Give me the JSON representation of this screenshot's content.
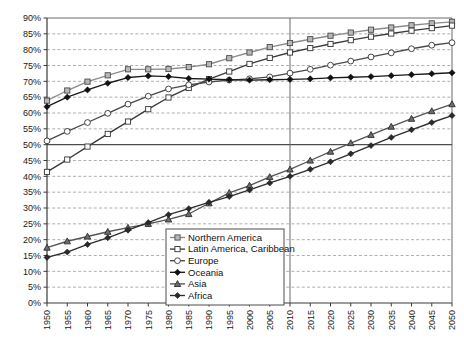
{
  "chart_data": {
    "type": "line",
    "title": "",
    "subtitle": "",
    "xlabel": "",
    "ylabel": "",
    "x": [
      1950,
      1955,
      1960,
      1965,
      1970,
      1975,
      1980,
      1985,
      1990,
      1995,
      2000,
      2005,
      2010,
      2015,
      2020,
      2025,
      2030,
      2035,
      2040,
      2045,
      2050
    ],
    "xlim": [
      1950,
      2050
    ],
    "ylim": [
      0,
      90
    ],
    "ytick_labels": [
      "0%",
      "5%",
      "10%",
      "15%",
      "20%",
      "25%",
      "30%",
      "35%",
      "40%",
      "45%",
      "50%",
      "55%",
      "60%",
      "65%",
      "70%",
      "75%",
      "80%",
      "85%",
      "90%"
    ],
    "ytick_values": [
      0,
      5,
      10,
      15,
      20,
      25,
      30,
      35,
      40,
      45,
      50,
      55,
      60,
      65,
      70,
      75,
      80,
      85,
      90
    ],
    "xtick_labels": [
      "1950",
      "1955",
      "1960",
      "1965",
      "1970",
      "1975",
      "1980",
      "1985",
      "1990",
      "1995",
      "2000",
      "2005",
      "2010",
      "2015",
      "2020",
      "2025",
      "2030",
      "2035",
      "2040",
      "2045",
      "2050"
    ],
    "grid": "horizontal-dashed",
    "emphasis_hline": 50,
    "divider_vline": 2010,
    "legend_position": "bottom-center",
    "series": [
      {
        "name": "Northern America",
        "marker": "square-open-gray",
        "color": "#8c8c8c",
        "values": [
          63.9,
          67.1,
          69.9,
          71.9,
          73.8,
          73.8,
          73.9,
          74.5,
          75.4,
          77.3,
          79.1,
          80.8,
          82.1,
          83.3,
          84.4,
          85.4,
          86.3,
          87.0,
          87.7,
          88.3,
          88.8
        ]
      },
      {
        "name": "Latin America, Caribbean",
        "marker": "square-open-white",
        "color": "#3a3a3a",
        "values": [
          41.4,
          45.3,
          49.4,
          53.4,
          57.3,
          61.2,
          64.9,
          67.9,
          70.7,
          73.1,
          75.5,
          77.4,
          79.1,
          80.5,
          81.8,
          83.0,
          84.1,
          85.1,
          86.0,
          86.8,
          87.6
        ]
      },
      {
        "name": "Europe",
        "marker": "circle-open-white",
        "color": "#4a4a4a",
        "values": [
          51.2,
          54.2,
          57.0,
          59.9,
          62.8,
          65.3,
          67.6,
          68.9,
          69.8,
          70.4,
          70.8,
          71.4,
          72.6,
          73.8,
          75.1,
          76.4,
          77.7,
          79.0,
          80.3,
          81.4,
          82.2
        ]
      },
      {
        "name": "Oceania",
        "marker": "diamond-filled",
        "color": "#1a1a1a",
        "values": [
          62.0,
          65.0,
          67.3,
          69.4,
          71.2,
          71.7,
          71.5,
          70.9,
          70.7,
          70.5,
          70.4,
          70.5,
          70.6,
          70.8,
          71.1,
          71.3,
          71.5,
          71.8,
          72.1,
          72.4,
          72.7
        ]
      },
      {
        "name": "Asia",
        "marker": "triangle-filled-gray",
        "color": "#555555",
        "values": [
          17.5,
          19.5,
          21.0,
          22.5,
          23.8,
          25.0,
          26.4,
          28.1,
          31.5,
          34.8,
          37.1,
          39.8,
          42.2,
          45.0,
          47.8,
          50.5,
          53.1,
          55.7,
          58.2,
          60.6,
          62.8
        ]
      },
      {
        "name": "Africa",
        "marker": "diamond-filled-small",
        "color": "#2e2e2e",
        "values": [
          14.4,
          16.1,
          18.5,
          20.6,
          23.0,
          25.4,
          27.9,
          29.8,
          31.8,
          33.6,
          35.7,
          37.9,
          40.0,
          42.2,
          44.6,
          47.1,
          49.7,
          52.3,
          54.7,
          57.0,
          59.2
        ]
      }
    ]
  },
  "legend": {
    "items": [
      {
        "label": "Northern America"
      },
      {
        "label": "Latin America, Caribbean"
      },
      {
        "label": "Europe"
      },
      {
        "label": "Oceania"
      },
      {
        "label": "Asia"
      },
      {
        "label": "Africa"
      }
    ]
  }
}
